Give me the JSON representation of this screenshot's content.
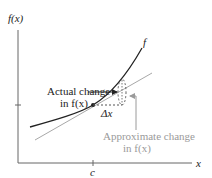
{
  "diagram": {
    "axes": {
      "y_label": "f(x)",
      "x_label": "x",
      "x_tick_label": "c"
    },
    "curve_label": "f",
    "delta_x_label": "Δx",
    "actual_change": {
      "line1": "Actual change",
      "line2": "in f(x)"
    },
    "approx_change": {
      "line1": "Approximate change",
      "line2": "in f(x)"
    },
    "colors": {
      "curve": "#222222",
      "axes": "#555555",
      "tangent": "#a0a0a0",
      "approx_text": "#9a9a9a",
      "text": "#222222"
    }
  }
}
